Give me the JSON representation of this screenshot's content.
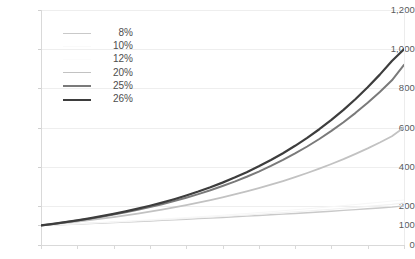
{
  "chart_data": {
    "type": "line",
    "title": "",
    "subtitle": "",
    "xlabel": "",
    "ylabel": "",
    "ylim": [
      0,
      1200
    ],
    "grid": true,
    "legend_position": "inside-upper-left",
    "background_color": "#ffffff",
    "y_ticks": [
      "0",
      "100",
      "200",
      "400",
      "600",
      "800",
      "1,000",
      "1,200"
    ],
    "y_tick_values": [
      0,
      100,
      200,
      400,
      600,
      800,
      1000,
      1200
    ],
    "x": [
      0,
      1,
      2,
      3,
      4,
      5,
      6,
      7,
      8,
      9,
      10,
      11,
      12,
      13,
      14,
      15,
      16,
      17,
      18,
      19,
      20,
      21,
      22,
      23,
      24,
      25,
      26,
      27,
      28,
      29,
      30
    ],
    "x_tick_labels": [
      "",
      "",
      "",
      "",
      "",
      "",
      "",
      "",
      "",
      "",
      ""
    ],
    "x_tick_labels_clipped": true,
    "categories": [
      0,
      1,
      2,
      3,
      4,
      5,
      6,
      7,
      8,
      9,
      10,
      11,
      12,
      13,
      14,
      15,
      16,
      17,
      18,
      19,
      20,
      21,
      22,
      23,
      24,
      25,
      26,
      27,
      28,
      29,
      30
    ],
    "series": [
      {
        "name": "8%",
        "color": "#c9c9c9",
        "width": 1.4,
        "start_value": 100,
        "end_value": 200,
        "values": [
          100,
          102.3,
          104.7,
          107.1,
          109.6,
          112.1,
          114.7,
          117.3,
          120.0,
          122.8,
          125.6,
          128.5,
          131.4,
          134.5,
          137.5,
          140.7,
          143.9,
          147.2,
          150.6,
          154.1,
          157.6,
          161.2,
          164.9,
          168.7,
          172.6,
          176.6,
          180.6,
          184.8,
          189.0,
          193.4,
          200.0
        ]
      },
      {
        "name": "10%",
        "color": "#f2f2f2",
        "width": 1.1,
        "start_value": 100,
        "end_value": 215,
        "values": [
          100,
          102.6,
          105.2,
          107.9,
          110.7,
          113.5,
          116.4,
          119.4,
          122.4,
          125.6,
          128.8,
          132.0,
          135.4,
          138.8,
          142.3,
          145.9,
          149.6,
          153.4,
          157.3,
          161.3,
          165.4,
          169.6,
          173.9,
          178.3,
          182.8,
          187.4,
          192.2,
          197.1,
          202.1,
          207.2,
          215.0
        ]
      },
      {
        "name": "12%",
        "color": "#f7f7f7",
        "width": 1.1,
        "start_value": 100,
        "end_value": 230,
        "values": [
          100,
          102.8,
          105.7,
          108.7,
          111.8,
          115.0,
          118.3,
          121.6,
          125.1,
          128.6,
          132.3,
          136.0,
          139.9,
          143.8,
          147.9,
          152.1,
          156.4,
          160.8,
          165.4,
          170.1,
          174.9,
          179.8,
          184.9,
          190.1,
          195.5,
          201.0,
          206.7,
          212.6,
          218.6,
          224.8,
          230.0
        ]
      },
      {
        "name": "20%",
        "color": "#c2c2c2",
        "width": 1.8,
        "start_value": 100,
        "end_value": 600,
        "values": [
          100,
          106.2,
          112.7,
          119.6,
          126.9,
          134.6,
          142.8,
          151.5,
          160.7,
          170.5,
          180.9,
          191.9,
          203.6,
          216.0,
          229.2,
          243.2,
          258.0,
          273.7,
          290.4,
          308.0,
          326.7,
          346.6,
          367.6,
          389.9,
          413.6,
          438.7,
          465.4,
          493.6,
          523.6,
          555.4,
          600.0
        ]
      },
      {
        "name": "25%",
        "color": "#7a7a7a",
        "width": 2.0,
        "start_value": 100,
        "end_value": 920,
        "values": [
          100,
          107.6,
          115.9,
          124.7,
          134.2,
          144.4,
          155.4,
          167.3,
          180.0,
          193.7,
          208.5,
          224.4,
          241.5,
          259.9,
          279.7,
          301.0,
          323.9,
          348.5,
          375.0,
          403.6,
          434.3,
          467.4,
          503.0,
          541.4,
          582.6,
          627.0,
          674.8,
          726.3,
          781.6,
          841.2,
          920.0
        ]
      },
      {
        "name": "26%",
        "color": "#3d3d3d",
        "width": 2.2,
        "start_value": 100,
        "end_value": 1000,
        "values": [
          100,
          108.0,
          116.7,
          126.1,
          136.2,
          147.1,
          158.9,
          171.7,
          185.5,
          200.4,
          216.5,
          233.9,
          252.7,
          273.0,
          294.9,
          318.6,
          344.2,
          371.9,
          401.7,
          434.0,
          468.8,
          506.5,
          547.2,
          591.1,
          638.6,
          690.0,
          745.4,
          805.3,
          870.0,
          939.9,
          1000.0
        ]
      }
    ]
  },
  "legend": {
    "items": [
      {
        "label": "8%",
        "color": "#c9c9c9",
        "width": 1.4
      },
      {
        "label": "10%",
        "color": "#fafafa",
        "width": 1.0
      },
      {
        "label": "12%",
        "color": "#fcfcfc",
        "width": 1.0
      },
      {
        "label": "20%",
        "color": "#c2c2c2",
        "width": 1.8
      },
      {
        "label": "25%",
        "color": "#7a7a7a",
        "width": 2.0
      },
      {
        "label": "26%",
        "color": "#3d3d3d",
        "width": 2.4
      }
    ]
  },
  "axes": {
    "y_axis_color": "#d9d9d9",
    "x_axis_color": "#d9d9d9",
    "gridline_color": "#eeeeee",
    "tick_label_color": "#5a5a5a"
  }
}
